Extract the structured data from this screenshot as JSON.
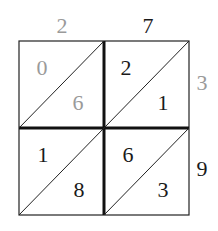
{
  "diagram": {
    "type": "lattice-multiplication",
    "multiplicand": [
      "2",
      "7"
    ],
    "multiplier": [
      "3",
      "9"
    ],
    "colors": {
      "gray": "#9a9a9a",
      "black": "#1a1a1a"
    },
    "top_digits": [
      {
        "text": "2",
        "color": "gray"
      },
      {
        "text": "7",
        "color": "black"
      }
    ],
    "right_digits": [
      {
        "text": "3",
        "color": "gray"
      },
      {
        "text": "9",
        "color": "black"
      }
    ],
    "cells": [
      {
        "row": 0,
        "col": 0,
        "tens": "0",
        "ones": "6",
        "color": "gray"
      },
      {
        "row": 0,
        "col": 1,
        "tens": "2",
        "ones": "1",
        "color": "black"
      },
      {
        "row": 1,
        "col": 0,
        "tens": "1",
        "ones": "8",
        "color": "black"
      },
      {
        "row": 1,
        "col": 1,
        "tens": "6",
        "ones": "3",
        "color": "black"
      }
    ]
  }
}
